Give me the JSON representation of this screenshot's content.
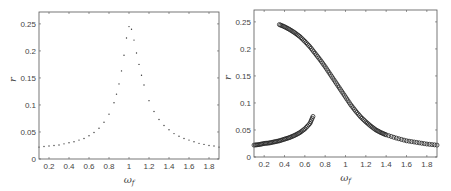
{
  "chart_data": [
    {
      "type": "scatter",
      "title": "",
      "xlabel": "ω_f",
      "ylabel": "r",
      "xlim": [
        0.1,
        1.9
      ],
      "ylim": [
        0,
        0.272
      ],
      "xticks": [
        0.2,
        0.4,
        0.6,
        0.8,
        1,
        1.2,
        1.4,
        1.6,
        1.8
      ],
      "xtick_labels": [
        "0.2",
        "0.4",
        "0.6",
        "0.8",
        "1",
        "1.2",
        "1.4",
        "1.6",
        "1.8"
      ],
      "yticks": [
        0,
        0.05,
        0.1,
        0.15,
        0.2,
        0.25
      ],
      "ytick_labels": [
        "0",
        "0.05",
        "0.1",
        "0.15",
        "0.2",
        "0.25"
      ],
      "grid": false,
      "legend": null,
      "box": {
        "left": 39,
        "top": 12,
        "right": 219,
        "bottom": 159
      },
      "series": [
        {
          "name": "r",
          "marker": "dot",
          "x": [
            0.1,
            0.15,
            0.2,
            0.25,
            0.3,
            0.35,
            0.4,
            0.45,
            0.5,
            0.55,
            0.6,
            0.65,
            0.7,
            0.75,
            0.8,
            0.85,
            0.875,
            0.9,
            0.925,
            0.95,
            0.975,
            1.0,
            1.025,
            1.05,
            1.075,
            1.1,
            1.125,
            1.15,
            1.2,
            1.25,
            1.3,
            1.35,
            1.4,
            1.45,
            1.5,
            1.55,
            1.6,
            1.65,
            1.7,
            1.75,
            1.8,
            1.85,
            1.9
          ],
          "y": [
            0.022,
            0.023,
            0.024,
            0.025,
            0.026,
            0.028,
            0.03,
            0.032,
            0.035,
            0.038,
            0.043,
            0.049,
            0.057,
            0.068,
            0.083,
            0.104,
            0.12,
            0.139,
            0.163,
            0.192,
            0.224,
            0.245,
            0.24,
            0.22,
            0.196,
            0.175,
            0.155,
            0.137,
            0.108,
            0.088,
            0.073,
            0.062,
            0.054,
            0.047,
            0.042,
            0.038,
            0.035,
            0.032,
            0.029,
            0.027,
            0.025,
            0.024,
            0.022
          ]
        }
      ]
    },
    {
      "type": "scatter",
      "title": "",
      "xlabel": "ω_f",
      "ylabel": "r",
      "xlim": [
        0.1,
        1.9
      ],
      "ylim": [
        0,
        0.272
      ],
      "xticks": [
        0.2,
        0.4,
        0.6,
        0.8,
        1,
        1.2,
        1.4,
        1.6,
        1.8
      ],
      "xtick_labels": [
        "0.2",
        "0.4",
        "0.6",
        "0.8",
        "1",
        "1.2",
        "1.4",
        "1.6",
        "1.8"
      ],
      "yticks": [
        0,
        0.05,
        0.1,
        0.15,
        0.2,
        0.25
      ],
      "ytick_labels": [
        "0",
        "0.05",
        "0.1",
        "0.15",
        "0.2",
        "0.25"
      ],
      "grid": false,
      "legend": null,
      "box": {
        "left": 254,
        "top": 10,
        "right": 437,
        "bottom": 157
      },
      "series": [
        {
          "name": "upper branch",
          "marker": "circle",
          "x": [
            0.35,
            0.4,
            0.45,
            0.5,
            0.55,
            0.6,
            0.65,
            0.7,
            0.75,
            0.8,
            0.85,
            0.9,
            0.95,
            1.0,
            1.05,
            1.1,
            1.15,
            1.2,
            1.25,
            1.3,
            1.35,
            1.4,
            1.5,
            1.6,
            1.7,
            1.8,
            1.9
          ],
          "y": [
            0.245,
            0.241,
            0.236,
            0.23,
            0.223,
            0.214,
            0.204,
            0.192,
            0.18,
            0.167,
            0.153,
            0.139,
            0.125,
            0.111,
            0.097,
            0.085,
            0.074,
            0.065,
            0.057,
            0.05,
            0.045,
            0.041,
            0.035,
            0.03,
            0.027,
            0.024,
            0.022
          ]
        },
        {
          "name": "lower branch",
          "marker": "circle",
          "x": [
            0.1,
            0.15,
            0.2,
            0.25,
            0.3,
            0.35,
            0.4,
            0.45,
            0.5,
            0.55,
            0.6,
            0.65,
            0.68
          ],
          "y": [
            0.022,
            0.023,
            0.025,
            0.026,
            0.028,
            0.03,
            0.033,
            0.036,
            0.04,
            0.045,
            0.052,
            0.062,
            0.075
          ]
        }
      ]
    }
  ],
  "panels": [
    {
      "xlabel": "ω",
      "xlabel_sub": "f",
      "ylabel": "r"
    },
    {
      "xlabel": "ω",
      "xlabel_sub": "f",
      "ylabel": "r"
    }
  ]
}
